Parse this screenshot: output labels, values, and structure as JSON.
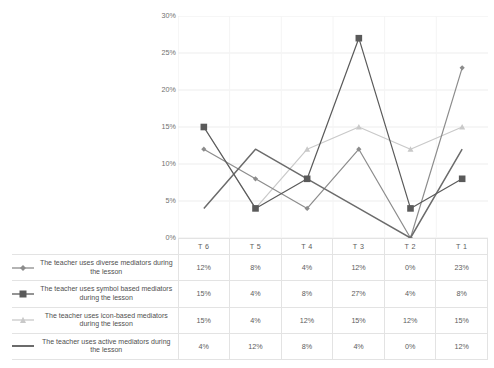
{
  "chart_data": {
    "type": "line",
    "title": "",
    "xlabel": "",
    "ylabel": "",
    "categories": [
      "T 6",
      "T 5",
      "T 4",
      "T 3",
      "T 2",
      "T 1"
    ],
    "ylim": [
      0,
      30
    ],
    "ytick_labels": [
      "0%",
      "5%",
      "10%",
      "15%",
      "20%",
      "25%",
      "30%"
    ],
    "ytick_values": [
      0,
      5,
      10,
      15,
      20,
      25,
      30
    ],
    "grid": true,
    "legend_position": "bottom-table",
    "series": [
      {
        "name": "The teacher uses diverse mediators during the lesson",
        "marker": "diamond",
        "color": "#8c8c8c",
        "values": [
          12,
          8,
          4,
          12,
          0,
          23
        ],
        "labels": [
          "12%",
          "8%",
          "4%",
          "12%",
          "0%",
          "23%"
        ]
      },
      {
        "name": "The teacher uses symbol based mediators during the lesson",
        "marker": "square",
        "color": "#5a5a5a",
        "values": [
          15,
          4,
          8,
          27,
          4,
          8
        ],
        "labels": [
          "15%",
          "4%",
          "8%",
          "27%",
          "4%",
          "8%"
        ]
      },
      {
        "name": "The teacher uses icon-based mediators during the lesson",
        "marker": "triangle",
        "color": "#c9c9c9",
        "values": [
          15,
          4,
          12,
          15,
          12,
          15
        ],
        "labels": [
          "15%",
          "4%",
          "12%",
          "15%",
          "12%",
          "15%"
        ]
      },
      {
        "name": "The teacher uses active mediators during the lesson",
        "marker": "none",
        "color": "#6b6b6b",
        "values": [
          4,
          12,
          8,
          4,
          0,
          12
        ],
        "labels": [
          "4%",
          "12%",
          "8%",
          "4%",
          "0%",
          "12%"
        ]
      }
    ]
  },
  "colors": {
    "grid": "#ededed",
    "axis_text": "#6f6f6f",
    "table_border": "#e3e3e3",
    "background": "#ffffff"
  }
}
